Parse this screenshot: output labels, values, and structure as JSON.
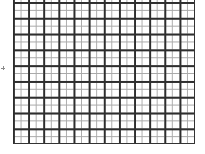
{
  "diagram": {
    "type": "graph-paper-grid",
    "major_columns": 12,
    "major_rows": 9,
    "minor_subdivisions": 2,
    "colors": {
      "major_line": "#2e2e2e",
      "minor_line": "#a9a9a9",
      "background": "#ffffff"
    }
  },
  "marker": {
    "icon": "plus-mark-icon"
  }
}
